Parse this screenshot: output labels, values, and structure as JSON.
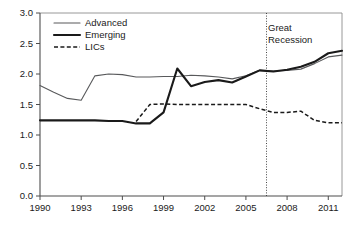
{
  "chart_data": {
    "type": "line",
    "title": "",
    "subtitle": "",
    "xlabel": "",
    "ylabel": "",
    "xlim": [
      1990,
      2012
    ],
    "ylim": [
      0.0,
      3.0
    ],
    "grid": false,
    "legend_position": "top-left",
    "y_ticks": [
      "0.0",
      "0.5",
      "1.0",
      "1.5",
      "2.0",
      "2.5",
      "3.0"
    ],
    "y_tick_values": [
      0.0,
      0.5,
      1.0,
      1.5,
      2.0,
      2.5,
      3.0
    ],
    "x_ticks": [
      "1990",
      "1993",
      "1996",
      "1999",
      "2002",
      "2005",
      "2008",
      "2011"
    ],
    "x_tick_values": [
      1990,
      1993,
      1996,
      1999,
      2002,
      2005,
      2008,
      2011
    ],
    "x": [
      1990,
      1991,
      1992,
      1993,
      1994,
      1995,
      1996,
      1997,
      1998,
      1999,
      2000,
      2001,
      2002,
      2003,
      2004,
      2005,
      2006,
      2007,
      2008,
      2009,
      2010,
      2011,
      2012
    ],
    "series": [
      {
        "name": "Advanced",
        "style": "solid-thin",
        "color": "#58595b",
        "values": [
          1.81,
          1.7,
          1.6,
          1.57,
          1.97,
          2.0,
          1.99,
          1.95,
          1.95,
          1.96,
          1.96,
          1.98,
          1.97,
          1.95,
          1.92,
          1.97,
          2.06,
          2.05,
          2.06,
          2.08,
          2.17,
          2.28,
          2.31
        ]
      },
      {
        "name": "Emerging",
        "style": "solid-thick",
        "color": "#1a1a1a",
        "values": [
          1.24,
          1.24,
          1.24,
          1.24,
          1.24,
          1.23,
          1.23,
          1.19,
          1.19,
          1.37,
          2.09,
          1.8,
          1.87,
          1.9,
          1.86,
          1.96,
          2.06,
          2.04,
          2.07,
          2.12,
          2.2,
          2.34,
          2.38
        ]
      },
      {
        "name": "LICs",
        "style": "dashed",
        "color": "#1a1a1a",
        "values": [
          null,
          null,
          null,
          null,
          null,
          null,
          null,
          1.22,
          1.5,
          1.51,
          1.5,
          1.5,
          1.5,
          1.5,
          1.5,
          1.5,
          1.43,
          1.37,
          1.37,
          1.39,
          1.24,
          1.2,
          1.2
        ]
      }
    ],
    "annotations": [
      {
        "name": "great-recession",
        "text_line_1": "Great",
        "text_line_2": "Recession",
        "marker_type": "vertical-dotted-line",
        "x_value": 2006.5
      }
    ],
    "legend": [
      {
        "label": "Advanced",
        "style": "solid-thin"
      },
      {
        "label": "Emerging",
        "style": "solid-thick"
      },
      {
        "label": "LICs",
        "style": "dashed"
      }
    ]
  }
}
